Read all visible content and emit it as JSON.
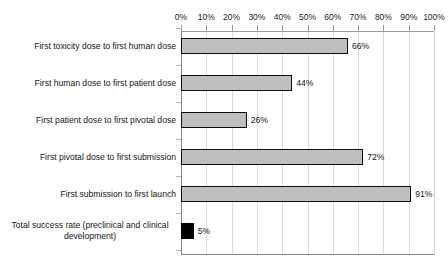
{
  "chart_data": {
    "type": "bar",
    "orientation": "horizontal",
    "title": "",
    "xlabel": "",
    "ylabel": "",
    "xlim": [
      0,
      100
    ],
    "grid": true,
    "legend": false,
    "axis_label_position": "top",
    "tick_labels": [
      "0%",
      "10%",
      "20%",
      "30%",
      "40%",
      "50%",
      "60%",
      "70%",
      "80%",
      "90%",
      "100%"
    ],
    "tick_values": [
      0,
      10,
      20,
      30,
      40,
      50,
      60,
      70,
      80,
      90,
      100
    ],
    "categories": [
      "First toxicity dose to first human dose",
      "First human dose to first patient dose",
      "First patient dose to first pivotal dose",
      "First pivotal dose to first submission",
      "First submission to first launch",
      "Total success rate (preclinical and clinical development)"
    ],
    "values": [
      66,
      44,
      26,
      72,
      91,
      5
    ],
    "value_labels": [
      "66%",
      "44%",
      "26%",
      "72%",
      "91%",
      "5%"
    ],
    "bar_colors": [
      "#bfbfbf",
      "#bfbfbf",
      "#bfbfbf",
      "#bfbfbf",
      "#bfbfbf",
      "#000000"
    ],
    "bar_border_color": "#0d0d0d",
    "gridline_color": "#d9d9d9",
    "axis_color": "#868686",
    "text_color": "#161616"
  }
}
